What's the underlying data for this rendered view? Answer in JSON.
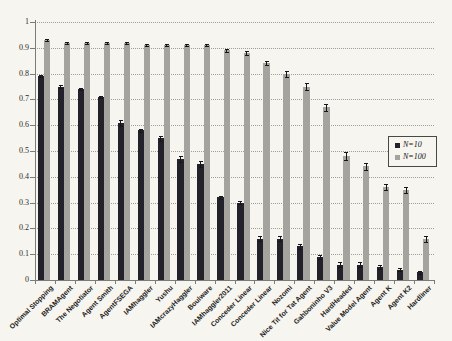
{
  "chart_data": {
    "type": "bar",
    "title": "",
    "xlabel": "",
    "ylabel": "",
    "ylim": [
      0,
      1
    ],
    "ytick_step": 0.1,
    "ytick_labels": [
      "0",
      "0.1",
      "0.2",
      "0.3",
      "0.4",
      "0.5",
      "0.6",
      "0.7",
      "0.8",
      "0.9",
      "1"
    ],
    "grid": "horizontal-dotted",
    "legend_position": "middle-right",
    "error_bars": true,
    "categories": [
      "Optimal Stopping",
      "BRAMAgent",
      "The Negotiator",
      "Agent Smith",
      "AgentFSEGA",
      "IAMhaggler",
      "Yushu",
      "IAMcrazyHaggler",
      "Boulware",
      "IAMhaggler2011",
      "Conceder Linear",
      "Conceder Linear",
      "Nozomi",
      "Nice Tit for Tat Agent",
      "Gahboninho V3",
      "HardHeaded",
      "Value Model Agent",
      "Agent K",
      "Agent K2",
      "Hardliner"
    ],
    "series": [
      {
        "name": "N=10",
        "color": "#23222b",
        "values": [
          0.79,
          0.75,
          0.74,
          0.71,
          0.61,
          0.58,
          0.55,
          0.47,
          0.45,
          0.32,
          0.3,
          0.16,
          0.16,
          0.13,
          0.09,
          0.06,
          0.06,
          0.05,
          0.04,
          0.03
        ],
        "errors": [
          0.005,
          0.005,
          0.005,
          0.005,
          0.012,
          0.006,
          0.01,
          0.012,
          0.012,
          0.006,
          0.006,
          0.01,
          0.01,
          0.008,
          0.008,
          0.008,
          0.008,
          0.008,
          0.006,
          0.005
        ]
      },
      {
        "name": "N=100",
        "color": "#a5a39e",
        "values": [
          0.93,
          0.92,
          0.92,
          0.92,
          0.92,
          0.91,
          0.91,
          0.91,
          0.91,
          0.89,
          0.88,
          0.84,
          0.8,
          0.75,
          0.67,
          0.48,
          0.44,
          0.36,
          0.35,
          0.16
        ],
        "errors": [
          0.004,
          0.004,
          0.004,
          0.004,
          0.004,
          0.004,
          0.004,
          0.004,
          0.004,
          0.006,
          0.006,
          0.008,
          0.012,
          0.012,
          0.014,
          0.015,
          0.015,
          0.012,
          0.012,
          0.012
        ]
      }
    ]
  },
  "colors": {
    "background": "#f7f5ef",
    "axis": "#7d7b76",
    "gridline": "#a09e97",
    "error_bar": "#15151a",
    "tick_text": "#2e2c29",
    "category_text": "#1f1e1c"
  }
}
